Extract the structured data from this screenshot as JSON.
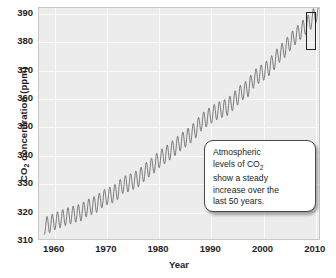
{
  "chart_data": {
    "type": "line",
    "title": "",
    "xlabel": "Year",
    "ylabel": "CO2 concentration (ppm)",
    "ylabel_parts": {
      "prefix": "CO",
      "sub": "2",
      "suffix": " concentration (ppm)"
    },
    "xlim": [
      1957,
      2011
    ],
    "ylim": [
      310,
      392
    ],
    "xticks": [
      1960,
      1970,
      1980,
      1990,
      2000,
      2010
    ],
    "yticks": [
      310,
      320,
      330,
      340,
      350,
      360,
      370,
      380,
      390
    ],
    "grid": true,
    "legend": "none",
    "series": [
      {
        "name": "Atmospheric CO2 at Mauna Loa",
        "description": "Monthly mean CO2 concentration with seasonal oscillation on a rising trend",
        "seasonal_amplitude_ppm": 3.0,
        "x": [
          1958,
          1959,
          1960,
          1961,
          1962,
          1963,
          1964,
          1965,
          1966,
          1967,
          1968,
          1969,
          1970,
          1971,
          1972,
          1973,
          1974,
          1975,
          1976,
          1977,
          1978,
          1979,
          1980,
          1981,
          1982,
          1983,
          1984,
          1985,
          1986,
          1987,
          1988,
          1989,
          1990,
          1991,
          1992,
          1993,
          1994,
          1995,
          1996,
          1997,
          1998,
          1999,
          2000,
          2001,
          2002,
          2003,
          2004,
          2005,
          2006,
          2007,
          2008,
          2009,
          2010
        ],
        "values": [
          315.3,
          315.9,
          316.9,
          317.6,
          318.4,
          319.0,
          319.6,
          320.0,
          321.4,
          322.2,
          323.0,
          324.6,
          325.7,
          326.3,
          327.5,
          329.7,
          330.2,
          331.1,
          332.0,
          333.8,
          335.4,
          336.8,
          338.7,
          340.1,
          341.4,
          343.0,
          344.6,
          346.0,
          347.4,
          349.2,
          351.6,
          353.1,
          354.4,
          355.6,
          356.4,
          357.1,
          358.8,
          360.8,
          362.6,
          363.7,
          366.7,
          368.4,
          369.5,
          371.1,
          373.2,
          375.8,
          377.5,
          379.8,
          381.9,
          383.8,
          385.6,
          387.4,
          389.9
        ]
      }
    ],
    "annotations": [
      {
        "name": "trend-callout",
        "text": "Atmospheric levels of CO2 show a steady increase over the last 50 years.",
        "lines": [
          "Atmospheric",
          "levels of CO",
          "show a steady",
          "increase over the",
          "last 50 years."
        ]
      },
      {
        "name": "final-peak-highlight",
        "type": "rectangle",
        "value_ppm": 390
      }
    ],
    "colors": {
      "plot_background": "#ececec",
      "gridline": "#fbfbfb",
      "curve": "#6b6b6b",
      "text": "#1d1d1d",
      "frame": "#c9c9c9",
      "callout_background": "#ffffff",
      "callout_border": "#4a4a4a"
    }
  },
  "callout": {
    "line1": "Atmospheric",
    "line2_prefix": "levels of CO",
    "line2_sub": "2",
    "line3": "show a steady",
    "line4": "increase over the",
    "line5": "last 50 years."
  },
  "axes": {
    "y_title_prefix": "CO",
    "y_title_sub": "2",
    "y_title_suffix": " concentration (ppm)",
    "x_title": "Year"
  }
}
